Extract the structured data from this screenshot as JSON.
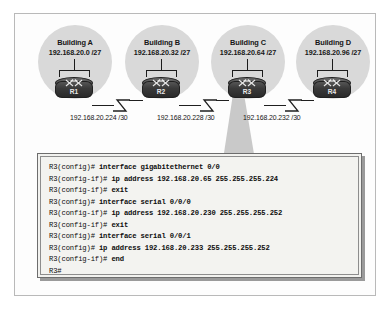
{
  "diagram": {
    "buildings": [
      {
        "name": "Building A",
        "network": "192.168.20.0 /27",
        "router": "R1"
      },
      {
        "name": "Building B",
        "network": "192.168.20.32 /27",
        "router": "R2"
      },
      {
        "name": "Building C",
        "network": "192.168.20.64 /27",
        "router": "R3"
      },
      {
        "name": "Building D",
        "network": "192.168.20.96 /27",
        "router": "R4"
      }
    ],
    "wan_links": [
      {
        "label": "192.168.20.224 /30",
        "from": "R1",
        "to": "R2"
      },
      {
        "label": "192.168.20.228 /30",
        "from": "R2",
        "to": "R3"
      },
      {
        "label": "192.168.20.232 /30",
        "from": "R3",
        "to": "R4"
      }
    ]
  },
  "console": {
    "device": "R3",
    "lines": [
      {
        "prompt": "R3(config)#",
        "command": " interface gigabitethernet 0/0"
      },
      {
        "prompt": "R3(config-if)#",
        "command": " ip address 192.168.20.65 255.255.255.224"
      },
      {
        "prompt": "R3(config-if)#",
        "command": " exit"
      },
      {
        "prompt": "R3(config)#",
        "command": " interface serial 0/0/0"
      },
      {
        "prompt": "R3(config-if)#",
        "command": " ip address 192.168.20.230 255.255.255.252"
      },
      {
        "prompt": "R3(config-if)#",
        "command": " exit"
      },
      {
        "prompt": "R3(config)#",
        "command": " interface serial 0/0/1"
      },
      {
        "prompt": "R3(config)#",
        "command": " ip address 192.168.20.233 255.255.255.252"
      },
      {
        "prompt": "R3(config-if)#",
        "command": " end"
      },
      {
        "prompt": "R3#",
        "command": ""
      }
    ]
  },
  "colors": {
    "cloud": "#d9d9d9",
    "router_body": "#3a3a3a",
    "console_bg": "#f2f2ef",
    "frame_border": "#b9b9b9",
    "line": "#1f1f1f"
  }
}
